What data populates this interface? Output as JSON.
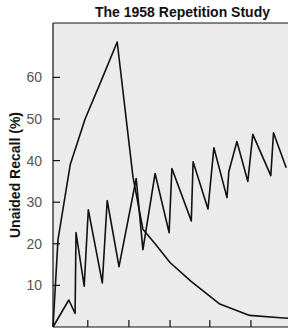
{
  "chart_data": {
    "type": "line",
    "title": "The 1958 Repetition Study",
    "xlabel": "",
    "ylabel": "Unaided Recall (%)",
    "ylim": [
      0,
      70
    ],
    "xlim": [
      0,
      52
    ],
    "yticks": [
      10,
      20,
      30,
      40,
      50,
      60
    ],
    "xticks_unlabeled": [
      7.7,
      16.8,
      25.9,
      34.7,
      43.8
    ],
    "grid": false,
    "legend": null,
    "background": "#ebebeb",
    "line_color": "#111111",
    "series": [
      {
        "name": "Concentrated exposure (rise then decay)",
        "points": [
          [
            0,
            0
          ],
          [
            1.1,
            21
          ],
          [
            3.8,
            39
          ],
          [
            7.1,
            50
          ],
          [
            10.4,
            58.5
          ],
          [
            14.2,
            68.5
          ],
          [
            17.7,
            36
          ],
          [
            19.9,
            23.5
          ],
          [
            22.6,
            20
          ],
          [
            25.9,
            15.5
          ],
          [
            30.5,
            11
          ],
          [
            36.9,
            5.5
          ],
          [
            43.5,
            2.8
          ],
          [
            50.3,
            2.2
          ],
          [
            52,
            2.1
          ]
        ]
      },
      {
        "name": "Spaced exposure (sawtooth)",
        "points": [
          [
            0,
            0
          ],
          [
            3.5,
            6.5
          ],
          [
            4.9,
            3.3
          ],
          [
            5.1,
            22.7
          ],
          [
            6.9,
            9.8
          ],
          [
            7.8,
            28.2
          ],
          [
            10.9,
            10.6
          ],
          [
            12.0,
            30.4
          ],
          [
            14.6,
            14.5
          ],
          [
            18.4,
            35.7
          ],
          [
            19.9,
            18.6
          ],
          [
            22.6,
            36.9
          ],
          [
            25.7,
            22.7
          ],
          [
            26.3,
            38.1
          ],
          [
            30.6,
            25.5
          ],
          [
            31.0,
            39.7
          ],
          [
            34.3,
            28.4
          ],
          [
            35.6,
            43.1
          ],
          [
            38.5,
            31.1
          ],
          [
            38.9,
            37.3
          ],
          [
            40.7,
            44.6
          ],
          [
            43.1,
            35.0
          ],
          [
            44.2,
            46.3
          ],
          [
            48.2,
            36.4
          ],
          [
            48.8,
            46.7
          ],
          [
            51.6,
            38.3
          ]
        ]
      }
    ]
  }
}
